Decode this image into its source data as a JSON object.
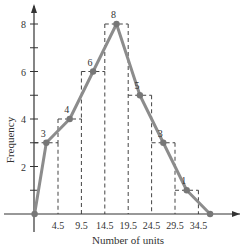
{
  "chart_data": {
    "type": "line",
    "subtype": "frequency-polygon-with-histogram-outline",
    "title": "",
    "xlabel": "Number of units",
    "ylabel": "Frequency",
    "x_tick_labels": [
      "4.5",
      "9.5",
      "14.5",
      "19.5",
      "24.5",
      "29.5",
      "34.5"
    ],
    "y_tick_labels": [
      "2",
      "4",
      "6",
      "8"
    ],
    "y_minor_ticks": [
      1,
      3,
      5,
      7
    ],
    "ylim": [
      0,
      8.5
    ],
    "xlim": [
      -3,
      42
    ],
    "class_boundaries": [
      -0.5,
      4.5,
      9.5,
      14.5,
      19.5,
      24.5,
      29.5,
      34.5,
      39.5
    ],
    "points": [
      {
        "x": -0.5,
        "y": 0,
        "label": ""
      },
      {
        "x": 2,
        "y": 3,
        "label": "3"
      },
      {
        "x": 7,
        "y": 4,
        "label": "4"
      },
      {
        "x": 12,
        "y": 6,
        "label": "6"
      },
      {
        "x": 17,
        "y": 8,
        "label": "8"
      },
      {
        "x": 22,
        "y": 5,
        "label": "5"
      },
      {
        "x": 27,
        "y": 3,
        "label": "3"
      },
      {
        "x": 32,
        "y": 1,
        "label": "1"
      },
      {
        "x": 37,
        "y": 0,
        "label": ""
      }
    ],
    "bars": [
      {
        "from": -0.5,
        "to": 4.5,
        "frequency": 3
      },
      {
        "from": 4.5,
        "to": 9.5,
        "frequency": 4
      },
      {
        "from": 9.5,
        "to": 14.5,
        "frequency": 6
      },
      {
        "from": 14.5,
        "to": 19.5,
        "frequency": 8
      },
      {
        "from": 19.5,
        "to": 24.5,
        "frequency": 5
      },
      {
        "from": 24.5,
        "to": 29.5,
        "frequency": 3
      },
      {
        "from": 29.5,
        "to": 34.5,
        "frequency": 1
      }
    ],
    "grid": false,
    "legend": null,
    "colors": {
      "polygon_line": "#8c8c8c",
      "points": "#777777",
      "dashed_outline": "#444444",
      "axes": "#333333"
    }
  }
}
